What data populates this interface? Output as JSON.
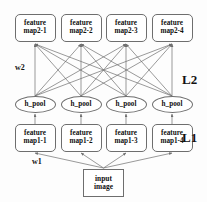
{
  "diagram": {
    "background_color": "#fdfdfd",
    "stroke_color": "#6e6e6e",
    "text_color": "#111111",
    "layers": {
      "feature_map2": {
        "nodes": [
          {
            "line1": "feature",
            "line2": "map2-1"
          },
          {
            "line1": "feature",
            "line2": "map2-2"
          },
          {
            "line1": "feature",
            "line2": "map2-3"
          },
          {
            "line1": "feature",
            "line2": "map2-4"
          }
        ]
      },
      "pool": {
        "nodes": [
          {
            "label": "h_pool"
          },
          {
            "label": "h_pool"
          },
          {
            "label": "h_pool"
          },
          {
            "label": "h_pool"
          }
        ]
      },
      "feature_map1": {
        "nodes": [
          {
            "line1": "feature",
            "line2": "map1-1"
          },
          {
            "line1": "feature",
            "line2": "map1-2"
          },
          {
            "line1": "feature",
            "line2": "map1-3"
          },
          {
            "line1": "feature",
            "line2": "map1-4"
          }
        ]
      },
      "input": {
        "line1": "input",
        "line2": "image"
      }
    },
    "labels": {
      "weight2": "w2",
      "weight1": "w1",
      "layer2": "L2",
      "layer1": "L1"
    }
  }
}
